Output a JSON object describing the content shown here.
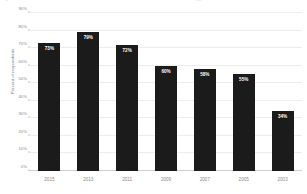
{
  "artifacts": {
    "left_glyph": "▫",
    "right_glyph": "▫▫"
  },
  "chart_data": {
    "type": "bar",
    "title": "",
    "xlabel": "",
    "ylabel": "Percent of respondents",
    "ylim": [
      0,
      90
    ],
    "grid": true,
    "legend": "none",
    "orientation": "vertical",
    "bar_color": "#1b1b1b",
    "gridline_color": "#ededed",
    "categories": [
      "2015",
      "2013",
      "2011",
      "2009",
      "2007",
      "2005",
      "2003"
    ],
    "values": [
      73,
      79,
      72,
      60,
      58,
      55,
      34
    ],
    "data_labels": [
      "73%",
      "79%",
      "72%",
      "60%",
      "58%",
      "55%",
      "34%"
    ],
    "ytick_values": [
      90,
      80,
      70,
      60,
      50,
      40,
      30,
      20,
      10,
      0
    ],
    "ytick_labels": [
      "90%",
      "80%",
      "70%",
      "60%",
      "50%",
      "40%",
      "30%",
      "20%",
      "10%",
      "0%"
    ]
  }
}
